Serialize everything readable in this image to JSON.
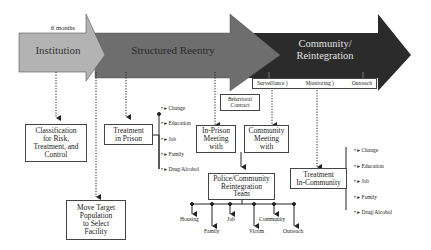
{
  "phases": [
    {
      "label": "Institution",
      "color": "#b3b3b3",
      "text_color": "#333333"
    },
    {
      "label": "Structured Reentry",
      "color": "#6e6e6e",
      "text_color": "#2a2a2a"
    },
    {
      "label_line1": "Community/",
      "label_line2": "Reintegration",
      "color": "#2b2b2b",
      "text_color": "#e0e0e0"
    }
  ],
  "duration_label": "6 months",
  "monitoring_bar": {
    "items": [
      "Surveillance )",
      "Monitoring )",
      "Outreach"
    ]
  },
  "boxes": {
    "classification": [
      "Classification",
      "for Risk,",
      "Treatment, and",
      "Control"
    ],
    "move_target": [
      "Move Target",
      "Population",
      "to Select",
      "Facility"
    ],
    "treatment_prison": [
      "Treatment",
      "in Prison"
    ],
    "behavioral_contract": [
      "Behavioral",
      "Contract"
    ],
    "in_prison_meeting": [
      "In-Prison",
      "Meeting",
      "with"
    ],
    "community_meeting": [
      "Community",
      "Meeting",
      "with"
    ],
    "reintegration_team": [
      "Police/Community",
      "Reintegration",
      "Team"
    ],
    "treatment_community": [
      "Treatment",
      "In-Community"
    ]
  },
  "prison_treatment_areas": [
    "Change",
    "Education",
    "Job",
    "Family",
    "Drug/Alcohol"
  ],
  "community_treatment_areas": [
    "Change",
    "Education",
    "Job",
    "Family",
    "Drug/Alcohol"
  ],
  "team_outputs": [
    "Housing",
    "Family",
    "Job",
    "Victim",
    "Community",
    "Outreach"
  ]
}
